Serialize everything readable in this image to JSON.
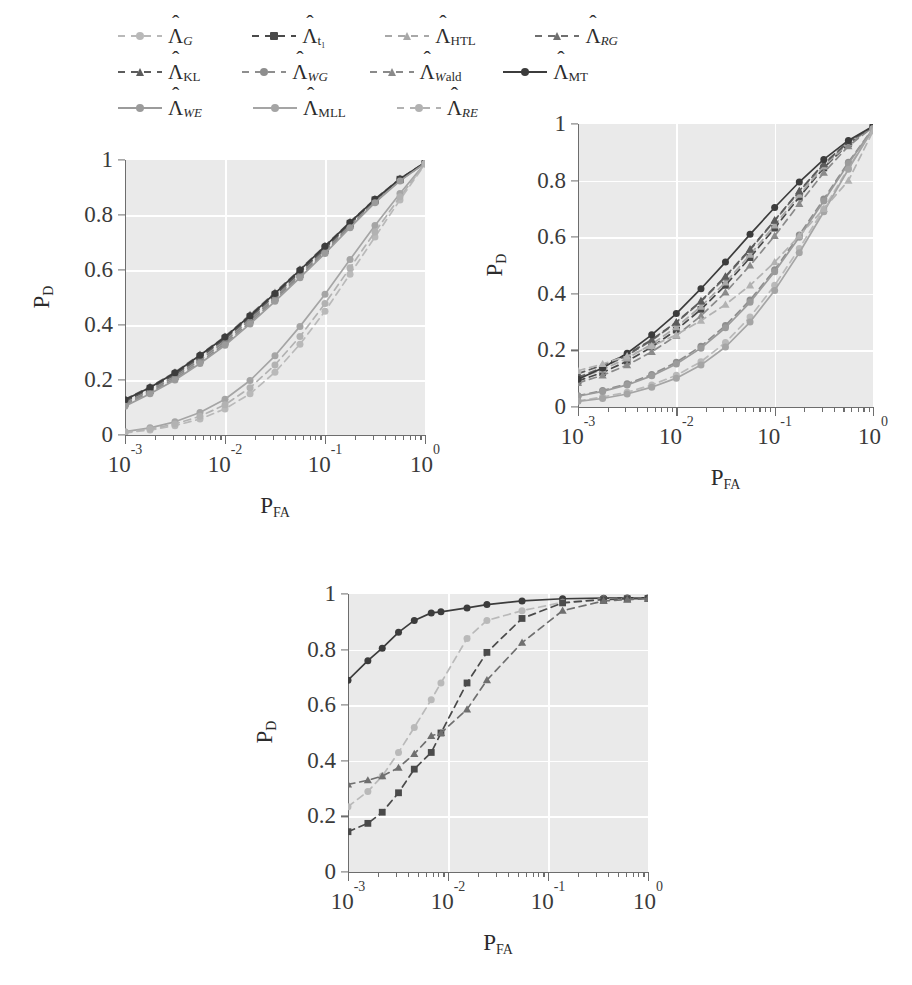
{
  "figure": {
    "kind": "roc-curve-figure",
    "panel_count": 3
  },
  "legend": {
    "position": "top",
    "rows": [
      [
        {
          "key": "G",
          "label_base": "Λ",
          "sub": "G",
          "style": "dashed",
          "marker": "circle",
          "color": "#b9b9b9"
        },
        {
          "key": "t1",
          "label_base": "Λ",
          "sub": "t₁",
          "style": "dashed",
          "marker": "square",
          "color": "#4a4a4a"
        },
        {
          "key": "HTL",
          "label_base": "Λ",
          "sub": "HTL",
          "style": "dashed",
          "marker": "tri",
          "color": "#a8a8a8"
        },
        {
          "key": "RG",
          "label_base": "Λ",
          "sub": "RG",
          "style": "dashed",
          "marker": "tri",
          "color": "#6f6f6f"
        }
      ],
      [
        {
          "key": "KL",
          "label_base": "Λ",
          "sub": "KL",
          "style": "dashed",
          "marker": "tri",
          "color": "#5c5c5c"
        },
        {
          "key": "WG",
          "label_base": "Λ",
          "sub": "WG",
          "style": "dashed",
          "marker": "circle",
          "color": "#8e8e8e"
        },
        {
          "key": "Wald",
          "label_base": "Λ",
          "sub": "Wald",
          "style": "dashed",
          "marker": "tri",
          "color": "#8a8a8a"
        },
        {
          "key": "MT",
          "label_base": "Λ",
          "sub": "MT",
          "style": "solid",
          "marker": "circle",
          "color": "#3c3c3c"
        }
      ],
      [
        {
          "key": "WE",
          "label_base": "Λ",
          "sub": "WE",
          "style": "solid",
          "marker": "circle",
          "color": "#9b9b9b"
        },
        {
          "key": "MLL",
          "label_base": "Λ",
          "sub": "MLL",
          "style": "solid",
          "marker": "circle",
          "color": "#a5a5a5"
        },
        {
          "key": "RE",
          "label_base": "Λ",
          "sub": "RE",
          "style": "dashed",
          "marker": "circle",
          "color": "#b2b2b2"
        }
      ]
    ]
  },
  "axes_common": {
    "xlabel_base": "P",
    "xlabel_sub": "FA",
    "ylabel_base": "P",
    "ylabel_sub": "D",
    "ytick_labels": [
      "1",
      "0.8",
      "0.6",
      "0.4",
      "0.2",
      "0"
    ],
    "ytick_values": [
      1,
      0.8,
      0.6,
      0.4,
      0.2,
      0
    ],
    "xtick_labels": [
      "10⁻³",
      "10⁻²",
      "10⁻¹",
      "10⁰"
    ],
    "xtick_exponents": [
      "-3",
      "-2",
      "-1",
      "0"
    ],
    "xlim_log": [
      -3,
      0
    ],
    "ylim": [
      0,
      1
    ],
    "xscale": "log",
    "grid": true,
    "grid_color": "#ffffff",
    "plot_bg": "#eaeaea"
  },
  "chart_data": [
    {
      "id": "panel-top-left",
      "type": "line",
      "title": "",
      "xlabel": "P_FA",
      "ylabel": "P_D",
      "xscale": "log",
      "xlim": [
        0.001,
        1
      ],
      "ylim": [
        0,
        1
      ],
      "grid": true,
      "legend_position": "figure-top",
      "x": [
        0.001,
        0.00178,
        0.00316,
        0.00562,
        0.01,
        0.0178,
        0.0316,
        0.0562,
        0.1,
        0.178,
        0.316,
        0.562,
        1.0
      ],
      "series": [
        {
          "name": "Λ_G",
          "color": "#b9b9b9",
          "style": "dashed",
          "marker": "circle",
          "values": [
            0.008,
            0.018,
            0.034,
            0.058,
            0.095,
            0.15,
            0.228,
            0.33,
            0.45,
            0.585,
            0.72,
            0.855,
            0.985
          ]
        },
        {
          "name": "Λ_t1",
          "color": "#4a4a4a",
          "style": "dashed",
          "marker": "square",
          "values": [
            0.125,
            0.17,
            0.222,
            0.285,
            0.352,
            0.43,
            0.51,
            0.595,
            0.68,
            0.77,
            0.855,
            0.93,
            0.99
          ]
        },
        {
          "name": "Λ_HTL",
          "color": "#a8a8a8",
          "style": "dashed",
          "marker": "tri",
          "values": [
            0.118,
            0.162,
            0.215,
            0.277,
            0.345,
            0.422,
            0.503,
            0.588,
            0.675,
            0.765,
            0.852,
            0.928,
            0.99
          ]
        },
        {
          "name": "Λ_RG",
          "color": "#6f6f6f",
          "style": "dashed",
          "marker": "tri",
          "values": [
            0.13,
            0.175,
            0.228,
            0.292,
            0.358,
            0.437,
            0.518,
            0.602,
            0.688,
            0.775,
            0.858,
            0.932,
            0.991
          ]
        },
        {
          "name": "Λ_KL",
          "color": "#5c5c5c",
          "style": "dashed",
          "marker": "tri",
          "values": [
            0.122,
            0.168,
            0.22,
            0.282,
            0.35,
            0.428,
            0.508,
            0.592,
            0.678,
            0.768,
            0.854,
            0.929,
            0.99
          ]
        },
        {
          "name": "Λ_WG",
          "color": "#8e8e8e",
          "style": "dashed",
          "marker": "circle",
          "values": [
            0.11,
            0.155,
            0.205,
            0.265,
            0.332,
            0.41,
            0.492,
            0.578,
            0.665,
            0.758,
            0.848,
            0.926,
            0.989
          ]
        },
        {
          "name": "Λ_Wald",
          "color": "#8a8a8a",
          "style": "dashed",
          "marker": "tri",
          "values": [
            0.115,
            0.16,
            0.212,
            0.272,
            0.34,
            0.418,
            0.498,
            0.583,
            0.67,
            0.762,
            0.85,
            0.927,
            0.99
          ]
        },
        {
          "name": "Λ_MT",
          "color": "#3c3c3c",
          "style": "solid",
          "marker": "circle",
          "values": [
            0.128,
            0.173,
            0.226,
            0.29,
            0.356,
            0.434,
            0.515,
            0.6,
            0.686,
            0.773,
            0.857,
            0.931,
            0.991
          ]
        },
        {
          "name": "Λ_WE",
          "color": "#9b9b9b",
          "style": "solid",
          "marker": "circle",
          "values": [
            0.105,
            0.15,
            0.2,
            0.26,
            0.326,
            0.404,
            0.486,
            0.572,
            0.66,
            0.754,
            0.845,
            0.924,
            0.988
          ]
        },
        {
          "name": "Λ_MLL",
          "color": "#a5a5a5",
          "style": "solid",
          "marker": "circle",
          "values": [
            0.012,
            0.026,
            0.048,
            0.082,
            0.13,
            0.198,
            0.288,
            0.395,
            0.512,
            0.638,
            0.762,
            0.878,
            0.988
          ]
        },
        {
          "name": "Λ_RE",
          "color": "#b2b2b2",
          "style": "dashed",
          "marker": "circle",
          "values": [
            0.01,
            0.022,
            0.04,
            0.068,
            0.11,
            0.172,
            0.255,
            0.358,
            0.478,
            0.608,
            0.738,
            0.866,
            0.986
          ]
        }
      ]
    },
    {
      "id": "panel-top-right",
      "type": "line",
      "title": "",
      "xlabel": "P_FA",
      "ylabel": "P_D",
      "xscale": "log",
      "xlim": [
        0.001,
        1
      ],
      "ylim": [
        0,
        1
      ],
      "grid": true,
      "legend_position": "figure-top",
      "x": [
        0.001,
        0.00178,
        0.00316,
        0.00562,
        0.01,
        0.0178,
        0.0316,
        0.0562,
        0.1,
        0.178,
        0.316,
        0.562,
        1.0
      ],
      "series": [
        {
          "name": "Λ_G",
          "color": "#b9b9b9",
          "style": "dashed",
          "marker": "circle",
          "values": [
            0.022,
            0.035,
            0.052,
            0.078,
            0.112,
            0.16,
            0.228,
            0.318,
            0.43,
            0.56,
            0.7,
            0.845,
            0.982
          ]
        },
        {
          "name": "Λ_t1",
          "color": "#4a4a4a",
          "style": "dashed",
          "marker": "square",
          "values": [
            0.092,
            0.122,
            0.162,
            0.212,
            0.272,
            0.345,
            0.43,
            0.528,
            0.632,
            0.742,
            0.845,
            0.93,
            0.99
          ]
        },
        {
          "name": "Λ_HTL",
          "color": "#a8a8a8",
          "style": "dashed",
          "marker": "tri",
          "values": [
            0.1,
            0.132,
            0.172,
            0.222,
            0.282,
            0.355,
            0.44,
            0.538,
            0.642,
            0.75,
            0.85,
            0.932,
            0.99
          ]
        },
        {
          "name": "Λ_RG",
          "color": "#6f6f6f",
          "style": "dashed",
          "marker": "tri",
          "values": [
            0.105,
            0.14,
            0.182,
            0.235,
            0.298,
            0.372,
            0.458,
            0.555,
            0.658,
            0.762,
            0.858,
            0.936,
            0.991
          ]
        },
        {
          "name": "Λ_KL",
          "color": "#5c5c5c",
          "style": "dashed",
          "marker": "tri",
          "values": [
            0.118,
            0.148,
            0.186,
            0.238,
            0.3,
            0.375,
            0.462,
            0.558,
            0.66,
            0.764,
            0.86,
            0.937,
            0.991
          ]
        },
        {
          "name": "Λ_WG",
          "color": "#8e8e8e",
          "style": "dashed",
          "marker": "circle",
          "values": [
            0.04,
            0.058,
            0.082,
            0.115,
            0.158,
            0.215,
            0.288,
            0.378,
            0.485,
            0.608,
            0.735,
            0.865,
            0.985
          ]
        },
        {
          "name": "Λ_Wald",
          "color": "#8a8a8a",
          "style": "dashed",
          "marker": "tri",
          "values": [
            0.085,
            0.112,
            0.148,
            0.195,
            0.252,
            0.322,
            0.405,
            0.5,
            0.605,
            0.718,
            0.828,
            0.922,
            0.989
          ]
        },
        {
          "name": "Λ_MT",
          "color": "#3c3c3c",
          "style": "solid",
          "marker": "circle",
          "values": [
            0.098,
            0.138,
            0.19,
            0.255,
            0.33,
            0.418,
            0.512,
            0.61,
            0.705,
            0.795,
            0.875,
            0.942,
            0.992
          ]
        },
        {
          "name": "Λ_WE",
          "color": "#9b9b9b",
          "style": "solid",
          "marker": "circle",
          "values": [
            0.038,
            0.055,
            0.078,
            0.11,
            0.152,
            0.208,
            0.28,
            0.37,
            0.478,
            0.6,
            0.728,
            0.86,
            0.984
          ]
        },
        {
          "name": "Λ_MLL",
          "color": "#a5a5a5",
          "style": "solid",
          "marker": "circle",
          "values": [
            0.02,
            0.03,
            0.046,
            0.07,
            0.102,
            0.148,
            0.212,
            0.3,
            0.412,
            0.545,
            0.69,
            0.84,
            0.982
          ]
        },
        {
          "name": "Λ_RE",
          "color": "#b2b2b2",
          "style": "dashed",
          "marker": "tri",
          "values": [
            0.128,
            0.152,
            0.18,
            0.215,
            0.255,
            0.305,
            0.362,
            0.43,
            0.512,
            0.605,
            0.7,
            0.8,
            0.975
          ]
        }
      ]
    },
    {
      "id": "panel-bottom",
      "type": "line",
      "title": "",
      "xlabel": "P_FA",
      "ylabel": "P_D",
      "xscale": "log",
      "xlim": [
        0.001,
        1
      ],
      "ylim": [
        0,
        1
      ],
      "grid": true,
      "legend_position": "figure-top",
      "x": [
        0.001,
        0.00158,
        0.0022,
        0.0032,
        0.0046,
        0.0068,
        0.0085,
        0.0155,
        0.0245,
        0.055,
        0.14,
        0.36,
        0.62,
        1.0
      ],
      "series": [
        {
          "name": "Λ_MT",
          "color": "#3c3c3c",
          "style": "solid",
          "marker": "circle",
          "values": [
            0.69,
            0.76,
            0.805,
            0.862,
            0.905,
            0.932,
            0.936,
            0.95,
            0.962,
            0.975,
            0.983,
            0.985,
            0.986,
            0.986
          ]
        },
        {
          "name": "Λ_G",
          "color": "#b9b9b9",
          "style": "dashed",
          "marker": "circle",
          "values": [
            0.235,
            0.29,
            0.345,
            0.43,
            0.52,
            0.62,
            0.68,
            0.84,
            0.905,
            0.94,
            0.97,
            0.982,
            0.984,
            0.985
          ]
        },
        {
          "name": "Λ_t1",
          "color": "#4a4a4a",
          "style": "dashed",
          "marker": "square",
          "values": [
            0.145,
            0.175,
            0.215,
            0.285,
            0.37,
            0.43,
            0.5,
            0.68,
            0.79,
            0.912,
            0.968,
            0.98,
            0.983,
            0.984
          ]
        },
        {
          "name": "Λ_KL",
          "color": "#6f6f6f",
          "style": "dashed",
          "marker": "tri",
          "values": [
            0.315,
            0.33,
            0.345,
            0.375,
            0.425,
            0.49,
            0.5,
            0.585,
            0.69,
            0.825,
            0.94,
            0.975,
            0.98,
            0.983
          ]
        }
      ]
    }
  ]
}
